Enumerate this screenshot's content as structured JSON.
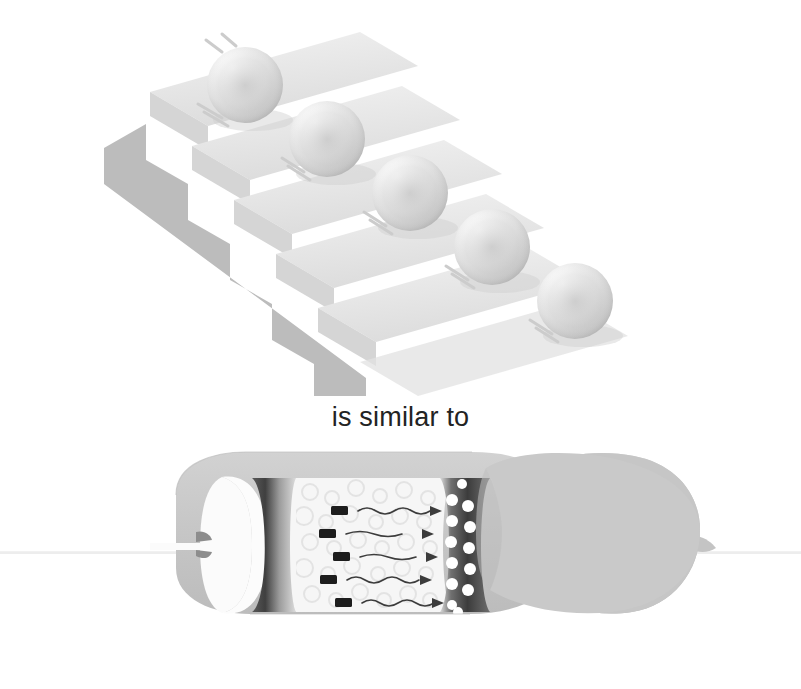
{
  "figure": {
    "width": 801,
    "height": 689,
    "background": "#ffffff"
  },
  "caption": {
    "text": "is similar to",
    "color": "#232323",
    "font_size_px": 27
  },
  "top_illustration": {
    "name": "staircase-with-rolling-spheres",
    "description": "Descending 3D staircase with one sphere resting on each tread",
    "step_count": 5,
    "sphere_count": 5,
    "colors": {
      "tread_light": "#ededed",
      "tread_shadow": "#dcdcdc",
      "riser_face": "#bdbdbd",
      "side_panel": "#b9b9b9",
      "sphere_light": "#fefefe",
      "sphere_mid": "#d8d8d8",
      "sphere_dark": "#a8a8a8"
    },
    "spheres": [
      {
        "label": "sphere-1",
        "cx": 245,
        "cy": 85,
        "r": 38
      },
      {
        "label": "sphere-2",
        "cx": 327,
        "cy": 139,
        "r": 38
      },
      {
        "label": "sphere-3",
        "cx": 410,
        "cy": 193,
        "r": 38
      },
      {
        "label": "sphere-4",
        "cx": 492,
        "cy": 247,
        "r": 38
      },
      {
        "label": "sphere-5",
        "cx": 575,
        "cy": 301,
        "r": 38
      }
    ]
  },
  "bottom_illustration": {
    "name": "membrane-cross-section",
    "description": "Cut-away cylindrical cell/organelle showing a pale interior channel with charged particles, wavy motion arrows, and a dark band studded with white vesicles",
    "colors": {
      "outer_body": "#c9c9c9",
      "outer_body_shadow": "#bcbcbc",
      "cut_rim_white": "#f7f7f7",
      "dark_band": "#4a4a4a",
      "band_gradient_light": "#d6d6d6",
      "interior_pale": "#f4f4f4",
      "vesicle_white": "#ffffff",
      "particle_dark": "#1a1a1a",
      "arrow_stroke": "#3a3a3a",
      "axis_line": "#efefef"
    },
    "particle_count": 5,
    "arrow_count": 5,
    "vesicle_count": 13,
    "particles": [
      {
        "label": "particle-1",
        "x": 338,
        "y": 511
      },
      {
        "label": "particle-2",
        "x": 326,
        "y": 534
      },
      {
        "label": "particle-3",
        "x": 340,
        "y": 557
      },
      {
        "label": "particle-4",
        "x": 327,
        "y": 580
      },
      {
        "label": "particle-5",
        "x": 342,
        "y": 603
      }
    ],
    "arrows": [
      {
        "label": "flow-arrow-1",
        "y": 511,
        "x_start": 360,
        "x_end": 432,
        "waves": 3
      },
      {
        "label": "flow-arrow-2",
        "y": 534,
        "x_start": 350,
        "x_end": 426,
        "waves": 2
      },
      {
        "label": "flow-arrow-3",
        "y": 557,
        "x_start": 362,
        "x_end": 430,
        "waves": 2
      },
      {
        "label": "flow-arrow-4",
        "y": 580,
        "x_start": 350,
        "x_end": 424,
        "waves": 3
      },
      {
        "label": "flow-arrow-5",
        "y": 603,
        "x_start": 364,
        "x_end": 432,
        "waves": 3
      }
    ],
    "vesicles": [
      {
        "cx": 452,
        "cy": 500,
        "r": 6
      },
      {
        "cx": 468,
        "cy": 506,
        "r": 6
      },
      {
        "cx": 452,
        "cy": 521,
        "r": 6
      },
      {
        "cx": 470,
        "cy": 527,
        "r": 6
      },
      {
        "cx": 451,
        "cy": 542,
        "r": 6
      },
      {
        "cx": 469,
        "cy": 548,
        "r": 6
      },
      {
        "cx": 452,
        "cy": 563,
        "r": 6
      },
      {
        "cx": 470,
        "cy": 569,
        "r": 6
      },
      {
        "cx": 452,
        "cy": 584,
        "r": 6
      },
      {
        "cx": 468,
        "cy": 590,
        "r": 6
      },
      {
        "cx": 452,
        "cy": 605,
        "r": 6
      },
      {
        "cx": 462,
        "cy": 483,
        "r": 5
      },
      {
        "cx": 458,
        "cy": 615,
        "r": 5
      }
    ]
  }
}
